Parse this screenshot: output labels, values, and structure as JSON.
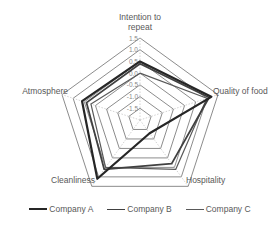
{
  "chart_data": {
    "type": "radar",
    "title": "",
    "categories": [
      "Intention to repeat",
      "Quality of food",
      "Hospitality",
      "Cleanliness",
      "Atmosphere"
    ],
    "category_label_lines": [
      [
        "Intention to",
        "repeat"
      ],
      [
        "Quality of food"
      ],
      [
        "Hospitality"
      ],
      [
        "Cleanliness"
      ],
      [
        "Atmosphere"
      ]
    ],
    "series": [
      {
        "name": "Company A",
        "values": [
          0.5,
          1.2,
          -1.3,
          1.1,
          0.6
        ],
        "color": "#262626",
        "width": 2.2
      },
      {
        "name": "Company B",
        "values": [
          0.4,
          1.1,
          0.3,
          0.6,
          0.4
        ],
        "color": "#404040",
        "width": 1.8
      },
      {
        "name": "Company C",
        "values": [
          0.0,
          1.0,
          0.6,
          0.5,
          0.2
        ],
        "color": "#595959",
        "width": 1.2
      }
    ],
    "rlim": [
      -2.0,
      1.5
    ],
    "ticks": [
      -1.5,
      -1.0,
      -0.5,
      0.0,
      0.5,
      1.0,
      1.5
    ],
    "tick_labels": [
      "-1.5",
      "-1.0",
      "-0.5",
      "0.0",
      "0.5",
      "1.0",
      "1.5"
    ],
    "grid": true,
    "legend_position": "bottom"
  },
  "legend": {
    "items": [
      {
        "label": "Company A",
        "color": "#262626"
      },
      {
        "label": "Company B",
        "color": "#404040"
      },
      {
        "label": "Company C",
        "color": "#595959"
      }
    ]
  }
}
